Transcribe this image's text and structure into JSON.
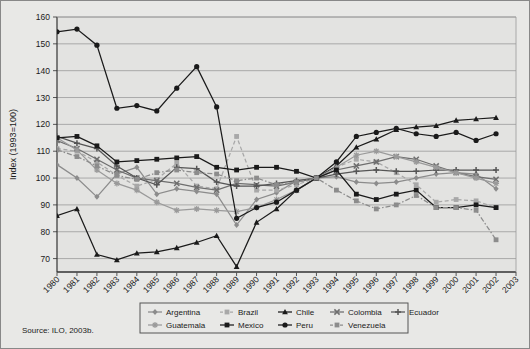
{
  "figure": {
    "background_color": "#e8e8e6",
    "plot_background_color": "#e3e3e1",
    "source_note": "Source: ILO, 2003b."
  },
  "chart_data": {
    "type": "line",
    "title": "",
    "subtitle": "",
    "xlabel": "",
    "ylabel": "Index (1993=100)",
    "xlim": [
      1980,
      2003
    ],
    "ylim": [
      65,
      160
    ],
    "yticks": [
      70,
      80,
      90,
      100,
      110,
      120,
      130,
      140,
      150,
      160
    ],
    "grid": "horizontal",
    "legend_position": "bottom-center",
    "x": [
      1980,
      1981,
      1982,
      1983,
      1984,
      1985,
      1986,
      1987,
      1988,
      1989,
      1990,
      1991,
      1992,
      1993,
      1994,
      1995,
      1996,
      1997,
      1998,
      1999,
      2000,
      2001,
      2002,
      2003
    ],
    "xtick_labels": [
      "1980",
      "1981",
      "1982",
      "1983",
      "1984",
      "1985",
      "1986",
      "1987",
      "1988",
      "1989",
      "1990",
      "1991",
      "1992",
      "1993",
      "1994",
      "1995",
      "1996",
      "1997",
      "1998",
      "1999",
      "2000",
      "2001",
      "2002",
      "2003"
    ],
    "series": [
      {
        "name": "Argentina",
        "color": "#8c8c8c",
        "marker": "diamond",
        "dash": "solid",
        "values": [
          105.0,
          100.0,
          93.0,
          101.5,
          104.0,
          94.0,
          96.0,
          95.0,
          94.0,
          82.5,
          92.0,
          94.5,
          99.0,
          100.0,
          100.5,
          98.5,
          98.0,
          98.5,
          100.0,
          101.5,
          102.0,
          101.5,
          96.0,
          null
        ]
      },
      {
        "name": "Brazil",
        "color": "#a8a8a8",
        "marker": "square",
        "dash": "dashed",
        "values": [
          111.0,
          110.0,
          106.0,
          101.0,
          97.0,
          99.5,
          105.5,
          97.0,
          96.0,
          115.5,
          95.5,
          95.5,
          97.5,
          100.0,
          104.0,
          107.0,
          106.0,
          102.0,
          97.5,
          91.0,
          92.0,
          91.5,
          89.0,
          null
        ]
      },
      {
        "name": "Chile",
        "color": "#1a1a1a",
        "marker": "triangle",
        "dash": "solid",
        "values": [
          86.0,
          88.5,
          71.5,
          69.5,
          72.0,
          72.5,
          74.0,
          76.0,
          78.5,
          67.0,
          83.5,
          88.5,
          95.5,
          100.0,
          104.5,
          111.5,
          114.5,
          118.0,
          119.0,
          119.5,
          121.5,
          122.0,
          122.5,
          null
        ]
      },
      {
        "name": "Colombia",
        "color": "#6e6e6e",
        "marker": "cross",
        "dash": "solid",
        "values": [
          114.0,
          111.0,
          107.0,
          103.0,
          100.0,
          99.0,
          98.0,
          96.5,
          95.5,
          98.0,
          97.5,
          97.0,
          98.5,
          100.0,
          103.0,
          104.5,
          106.0,
          108.0,
          107.0,
          104.5,
          102.0,
          100.5,
          99.5,
          null
        ]
      },
      {
        "name": "Ecuador",
        "color": "#555555",
        "marker": "plus",
        "dash": "solid",
        "values": [
          115.5,
          113.0,
          111.0,
          104.5,
          100.0,
          97.5,
          104.0,
          103.5,
          98.5,
          97.0,
          97.0,
          98.0,
          99.0,
          100.0,
          101.5,
          102.5,
          103.0,
          102.5,
          102.5,
          103.0,
          103.0,
          103.0,
          103.0,
          null
        ]
      },
      {
        "name": "Guatemala",
        "color": "#9a9a9a",
        "marker": "star",
        "dash": "solid",
        "values": [
          115.0,
          110.5,
          103.0,
          98.0,
          95.5,
          91.0,
          88.0,
          88.5,
          88.0,
          87.5,
          89.0,
          92.0,
          95.5,
          100.0,
          104.0,
          108.5,
          110.0,
          108.0,
          106.0,
          104.0,
          102.0,
          100.0,
          98.0,
          null
        ]
      },
      {
        "name": "Mexico",
        "color": "#1a1a1a",
        "marker": "square",
        "dash": "solid",
        "values": [
          115.0,
          115.5,
          112.0,
          106.0,
          106.5,
          107.0,
          107.5,
          108.0,
          104.0,
          103.0,
          104.0,
          104.0,
          102.5,
          100.0,
          103.0,
          94.0,
          92.0,
          94.0,
          95.5,
          89.0,
          89.0,
          90.0,
          89.0,
          null
        ]
      },
      {
        "name": "Peru",
        "color": "#1a1a1a",
        "marker": "circle",
        "dash": "solid",
        "values": [
          154.5,
          155.5,
          149.5,
          126.0,
          127.0,
          125.0,
          133.5,
          141.5,
          126.5,
          85.0,
          89.0,
          91.0,
          95.5,
          100.0,
          106.0,
          115.5,
          117.0,
          118.5,
          116.5,
          115.5,
          117.0,
          114.0,
          116.5,
          null
        ]
      },
      {
        "name": "Venezuela",
        "color": "#8c8c8c",
        "marker": "square",
        "dash": "dashdot",
        "values": [
          110.5,
          108.0,
          104.5,
          101.0,
          99.5,
          102.0,
          103.0,
          102.0,
          101.5,
          99.0,
          100.0,
          97.5,
          98.5,
          100.0,
          95.5,
          91.5,
          88.5,
          90.0,
          93.5,
          89.0,
          89.0,
          88.0,
          77.0,
          null
        ]
      }
    ]
  },
  "legend": {
    "rows": [
      [
        {
          "label": "Argentina",
          "color": "#8c8c8c",
          "marker": "diamond",
          "dash": "solid"
        },
        {
          "label": "Brazil",
          "color": "#a8a8a8",
          "marker": "square",
          "dash": "dashed"
        },
        {
          "label": "Chile",
          "color": "#1a1a1a",
          "marker": "triangle",
          "dash": "solid"
        },
        {
          "label": "Colombia",
          "color": "#6e6e6e",
          "marker": "cross",
          "dash": "solid"
        },
        {
          "label": "Ecuador",
          "color": "#555555",
          "marker": "plus",
          "dash": "solid"
        }
      ],
      [
        {
          "label": "Guatemala",
          "color": "#9a9a9a",
          "marker": "star",
          "dash": "solid"
        },
        {
          "label": "Mexico",
          "color": "#1a1a1a",
          "marker": "square",
          "dash": "solid"
        },
        {
          "label": "Peru",
          "color": "#1a1a1a",
          "marker": "circle",
          "dash": "solid"
        },
        {
          "label": "Venezuela",
          "color": "#8c8c8c",
          "marker": "square",
          "dash": "dashdot"
        }
      ]
    ]
  }
}
